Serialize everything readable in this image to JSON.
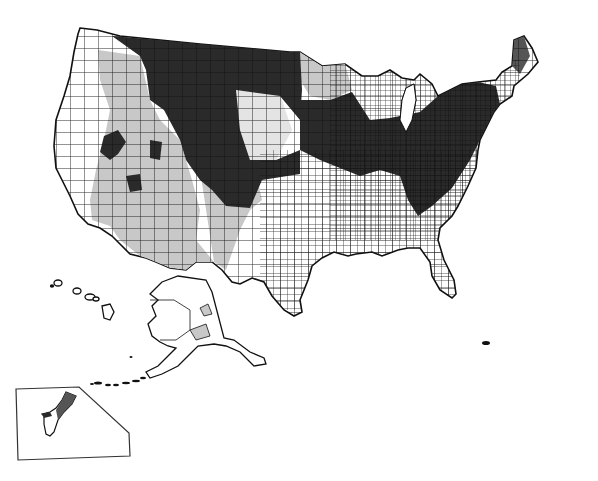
{
  "map": {
    "type": "choropleth",
    "geography": "United States counties",
    "regions_shown": [
      "Contiguous United States",
      "Alaska",
      "Hawaii",
      "Guam inset"
    ],
    "legend": null,
    "title": null,
    "shading_levels": [
      {
        "name": "low",
        "color": "#ffffff"
      },
      {
        "name": "medium",
        "color": "#c8c8c8"
      },
      {
        "name": "high",
        "color": "#2a2a2a"
      }
    ],
    "colors": {
      "background": "#ffffff",
      "border": "#111111",
      "light": "#ffffff",
      "medium": "#c8c8c8",
      "dark": "#2a2a2a"
    }
  }
}
